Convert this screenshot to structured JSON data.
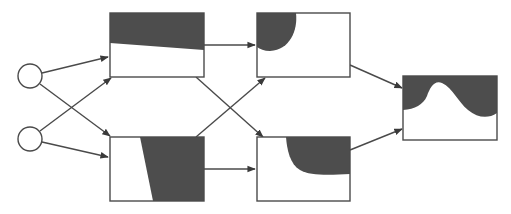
{
  "diagram": {
    "type": "neural-network-decision-regions",
    "colors": {
      "background": "#ffffff",
      "stroke": "#4a4a4a",
      "fill_region": "#4d4d4d",
      "node_fill": "#ffffff"
    },
    "inputs": [
      {
        "id": "input-1",
        "cx": 30,
        "cy": 76,
        "r": 12
      },
      {
        "id": "input-2",
        "cx": 30,
        "cy": 139,
        "r": 12
      }
    ],
    "units": [
      {
        "id": "hidden-1-top",
        "x": 110,
        "y": 13,
        "w": 94,
        "h": 64,
        "region": "linear-top"
      },
      {
        "id": "hidden-1-bottom",
        "x": 110,
        "y": 137,
        "w": 94,
        "h": 64,
        "region": "linear-right"
      },
      {
        "id": "hidden-2-top",
        "x": 257,
        "y": 13,
        "w": 93,
        "h": 64,
        "region": "quarter-circle-top-left"
      },
      {
        "id": "hidden-2-bottom",
        "x": 257,
        "y": 137,
        "w": 93,
        "h": 64,
        "region": "curve-top-right"
      },
      {
        "id": "output",
        "x": 403,
        "y": 76,
        "w": 94,
        "h": 64,
        "region": "wavy-top"
      }
    ],
    "edges": [
      {
        "from": "input-1",
        "to": "hidden-1-top"
      },
      {
        "from": "input-1",
        "to": "hidden-1-bottom"
      },
      {
        "from": "input-2",
        "to": "hidden-1-top"
      },
      {
        "from": "input-2",
        "to": "hidden-1-bottom"
      },
      {
        "from": "hidden-1-top",
        "to": "hidden-2-top"
      },
      {
        "from": "hidden-1-top",
        "to": "hidden-2-bottom"
      },
      {
        "from": "hidden-1-bottom",
        "to": "hidden-2-top"
      },
      {
        "from": "hidden-1-bottom",
        "to": "hidden-2-bottom"
      },
      {
        "from": "hidden-2-top",
        "to": "output"
      },
      {
        "from": "hidden-2-bottom",
        "to": "output"
      }
    ]
  }
}
